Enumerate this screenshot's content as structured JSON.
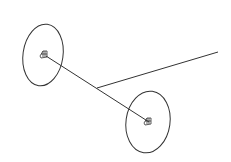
{
  "canvas": {
    "width": 231,
    "height": 162,
    "background": "#ffffff",
    "stroke": "#333333"
  },
  "diagram": {
    "wheels": [
      {
        "name": "left-wheel",
        "cx": 43,
        "cy": 55,
        "rx": 20,
        "ry": 31
      },
      {
        "name": "right-wheel",
        "cx": 148,
        "cy": 122,
        "rx": 22,
        "ry": 31
      }
    ],
    "axle": {
      "x1": 46,
      "y1": 56,
      "x2": 149,
      "y2": 122
    },
    "handle": {
      "x1": 97,
      "y1": 88,
      "x2": 218,
      "y2": 52
    }
  }
}
